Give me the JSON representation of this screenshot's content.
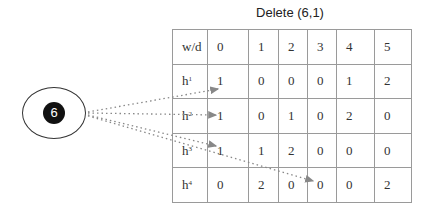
{
  "title": "Delete (6,1)",
  "node": {
    "label": "6"
  },
  "table": {
    "header": [
      "w/d",
      "0",
      "1",
      "2",
      "3",
      "4",
      "5"
    ],
    "rows": [
      {
        "label": "h",
        "sup": "1",
        "cells": [
          "1",
          "0",
          "0",
          "0",
          "1",
          "2"
        ]
      },
      {
        "label": "h",
        "sup": "2",
        "cells": [
          "1",
          "0",
          "1",
          "0",
          "2",
          "0"
        ]
      },
      {
        "label": "h",
        "sup": "3",
        "cells": [
          "1",
          "1",
          "2",
          "0",
          "0",
          "0"
        ]
      },
      {
        "label": "h",
        "sup": "4",
        "cells": [
          "0",
          "2",
          "0",
          "0",
          "0",
          "2"
        ]
      }
    ]
  },
  "arrows": [
    {
      "from": "node-6",
      "to": "h1,0"
    },
    {
      "from": "node-6",
      "to": "h2,0"
    },
    {
      "from": "node-6",
      "to": "h3,0"
    },
    {
      "from": "node-6",
      "to": "h4,3"
    }
  ],
  "colors": {
    "border": "#9a9a9a",
    "arrow": "#888888",
    "node_fill": "#111111"
  }
}
